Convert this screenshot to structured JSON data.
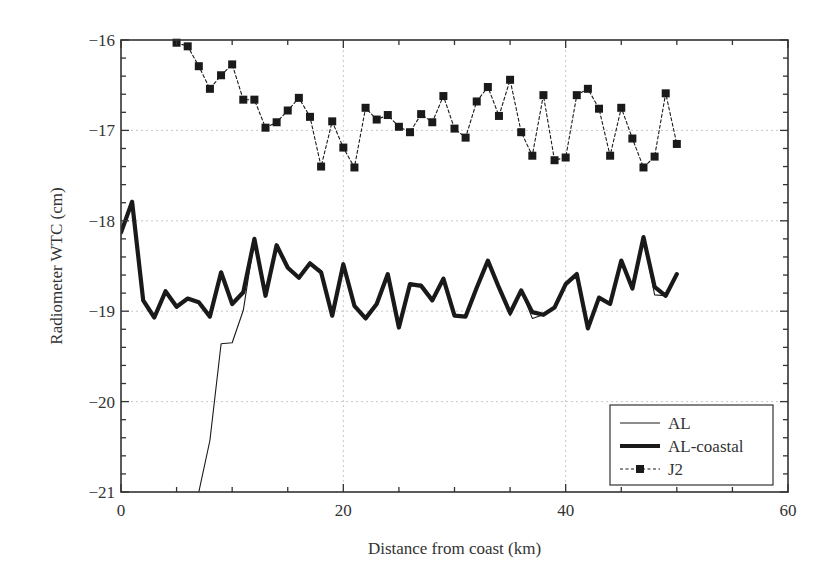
{
  "chart_data": {
    "type": "line",
    "title": "",
    "xlabel": "Distance from coast (km)",
    "ylabel": "Radiometer WTC (cm)",
    "xlim": [
      0,
      60
    ],
    "ylim": [
      -21,
      -16
    ],
    "xticks": [
      0,
      20,
      40,
      60
    ],
    "yticks": [
      -16,
      -17,
      -18,
      -19,
      -20,
      -21
    ],
    "xtick_labels": [
      "0",
      "20",
      "40",
      "60"
    ],
    "ytick_labels": [
      "−16",
      "−17",
      "−18",
      "−19",
      "−20",
      "−21"
    ],
    "grid": true,
    "legend_position": "lower right",
    "series": [
      {
        "name": "AL",
        "style": "thin-solid",
        "x": [
          7,
          8,
          9,
          10,
          11,
          12,
          13,
          14,
          15,
          16,
          17,
          18,
          19,
          20,
          21,
          22,
          23,
          24,
          25,
          26,
          27,
          28,
          29,
          30,
          31,
          32,
          33,
          34,
          35,
          36,
          37,
          38,
          39,
          40,
          41,
          42,
          43,
          44,
          45,
          46,
          47,
          48,
          49,
          50
        ],
        "values": [
          -21.0,
          -20.43,
          -19.36,
          -19.35,
          -18.99,
          -18.2,
          -18.83,
          -18.27,
          -18.52,
          -18.63,
          -18.47,
          -18.55,
          -19.05,
          -18.48,
          -18.94,
          -19.08,
          -18.92,
          -18.59,
          -19.18,
          -18.72,
          -18.7,
          -18.88,
          -18.64,
          -19.05,
          -19.06,
          -18.74,
          -18.44,
          -18.74,
          -19.05,
          -18.77,
          -19.08,
          -19.04,
          -18.96,
          -18.7,
          -18.59,
          -19.19,
          -18.85,
          -18.92,
          -18.44,
          -18.75,
          -18.18,
          -18.82,
          -18.83,
          -18.59
        ]
      },
      {
        "name": "AL-coastal",
        "style": "thick-solid",
        "x": [
          0,
          1,
          2,
          3,
          4,
          5,
          6,
          7,
          8,
          9,
          10,
          11,
          12,
          13,
          14,
          15,
          16,
          17,
          18,
          19,
          20,
          21,
          22,
          23,
          24,
          25,
          26,
          27,
          28,
          29,
          30,
          31,
          32,
          33,
          34,
          35,
          36,
          37,
          38,
          39,
          40,
          41,
          42,
          43,
          44,
          45,
          46,
          47,
          48,
          49,
          50
        ],
        "values": [
          -18.13,
          -17.79,
          -18.88,
          -19.07,
          -18.78,
          -18.95,
          -18.86,
          -18.9,
          -19.06,
          -18.57,
          -18.92,
          -18.79,
          -18.2,
          -18.83,
          -18.27,
          -18.52,
          -18.63,
          -18.47,
          -18.57,
          -19.05,
          -18.48,
          -18.94,
          -19.08,
          -18.92,
          -18.59,
          -19.18,
          -18.7,
          -18.72,
          -18.88,
          -18.64,
          -19.05,
          -19.06,
          -18.74,
          -18.44,
          -18.74,
          -19.02,
          -18.77,
          -19.01,
          -19.04,
          -18.96,
          -18.7,
          -18.59,
          -19.19,
          -18.85,
          -18.92,
          -18.44,
          -18.75,
          -18.18,
          -18.73,
          -18.83,
          -18.59
        ]
      },
      {
        "name": "J2",
        "style": "dashed-square-markers",
        "x": [
          5,
          6,
          7,
          8,
          9,
          10,
          11,
          12,
          13,
          14,
          15,
          16,
          17,
          18,
          19,
          20,
          21,
          22,
          23,
          24,
          25,
          26,
          27,
          28,
          29,
          30,
          31,
          32,
          33,
          34,
          35,
          36,
          37,
          38,
          39,
          40,
          41,
          42,
          43,
          44,
          45,
          46,
          47,
          48,
          49,
          50
        ],
        "values": [
          -16.03,
          -16.07,
          -16.29,
          -16.54,
          -16.39,
          -16.27,
          -16.66,
          -16.66,
          -16.97,
          -16.91,
          -16.78,
          -16.64,
          -16.85,
          -17.4,
          -16.9,
          -17.19,
          -17.41,
          -16.75,
          -16.88,
          -16.83,
          -16.96,
          -17.02,
          -16.82,
          -16.91,
          -16.62,
          -16.98,
          -17.08,
          -16.68,
          -16.52,
          -16.84,
          -16.44,
          -17.02,
          -17.28,
          -16.61,
          -17.33,
          -17.3,
          -16.61,
          -16.54,
          -16.76,
          -17.28,
          -16.75,
          -17.09,
          -17.41,
          -17.29,
          -16.59,
          -17.15
        ]
      }
    ]
  },
  "legend": {
    "items": [
      {
        "label": "AL"
      },
      {
        "label": "AL-coastal"
      },
      {
        "label": "J2"
      }
    ]
  },
  "colors": {
    "line": "#1a1a1a",
    "grid": "#c8c8c8",
    "axis": "#333333"
  }
}
